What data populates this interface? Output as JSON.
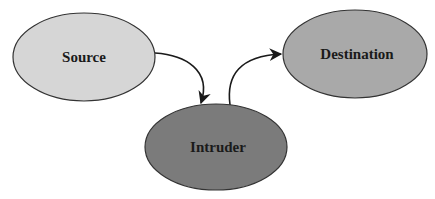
{
  "diagram": {
    "type": "flow",
    "nodes": [
      {
        "id": "source",
        "label": "Source",
        "color": "#d6d6d6"
      },
      {
        "id": "destination",
        "label": "Destination",
        "color": "#a9a9a9"
      },
      {
        "id": "intruder",
        "label": "Intruder",
        "color": "#7b7b7b"
      }
    ],
    "edges": [
      {
        "from": "source",
        "to": "intruder"
      },
      {
        "from": "intruder",
        "to": "destination"
      }
    ]
  }
}
